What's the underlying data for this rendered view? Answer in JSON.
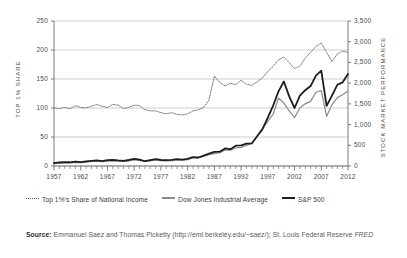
{
  "chart_data": {
    "type": "line",
    "title": "",
    "subtitle": "",
    "xlabel": "",
    "ylabel": "TOP 1% SHARE",
    "y2label": "STOCK MARKET PERFORMANCE",
    "grid": true,
    "legend_position": "bottom",
    "xlim": [
      1957,
      2012
    ],
    "ylim": [
      0,
      250
    ],
    "y2lim": [
      0,
      3500
    ],
    "x_ticks": [
      "1957",
      "1962",
      "1967",
      "1972",
      "1977",
      "1982",
      "1987",
      "1992",
      "1997",
      "2002",
      "2007",
      "2012"
    ],
    "x_minor_tick_interval": 1,
    "y_ticks_left": [
      "0",
      "50",
      "100",
      "150",
      "200",
      "250"
    ],
    "y_ticks_right": [
      "0",
      "500",
      "1,000",
      "1,500",
      "2,000",
      "2,500",
      "3,000",
      "3,500"
    ],
    "x": [
      1957,
      1958,
      1959,
      1960,
      1961,
      1962,
      1963,
      1964,
      1965,
      1966,
      1967,
      1968,
      1969,
      1970,
      1971,
      1972,
      1973,
      1974,
      1975,
      1976,
      1977,
      1978,
      1979,
      1980,
      1981,
      1982,
      1983,
      1984,
      1985,
      1986,
      1987,
      1988,
      1989,
      1990,
      1991,
      1992,
      1993,
      1994,
      1995,
      1996,
      1997,
      1998,
      1999,
      2000,
      2001,
      2002,
      2003,
      2004,
      2005,
      2006,
      2007,
      2008,
      2009,
      2010,
      2011,
      2012
    ],
    "series": [
      {
        "name": "Top 1%'s Share of National Income",
        "axis": "left",
        "style": "dotted",
        "color": "#666666",
        "values": [
          100,
          99,
          101,
          99,
          104,
          101,
          100,
          103,
          106,
          103,
          101,
          106,
          105,
          99,
          101,
          105,
          104,
          97,
          95,
          95,
          92,
          90,
          92,
          89,
          88,
          90,
          95,
          97,
          101,
          114,
          155,
          144,
          138,
          143,
          140,
          148,
          141,
          139,
          145,
          152,
          163,
          172,
          183,
          188,
          178,
          168,
          172,
          186,
          196,
          206,
          212,
          196,
          180,
          193,
          198,
          196
        ]
      },
      {
        "name": "Dow Jones Industrial Average",
        "axis": "right",
        "style": "solid",
        "color": "#8d8d8d",
        "values": [
          60,
          75,
          80,
          75,
          90,
          80,
          95,
          110,
          115,
          105,
          120,
          125,
          115,
          110,
          125,
          145,
          135,
          110,
          125,
          145,
          130,
          125,
          130,
          145,
          140,
          155,
          200,
          195,
          230,
          275,
          300,
          320,
          390,
          380,
          440,
          450,
          500,
          545,
          715,
          905,
          1080,
          1250,
          1640,
          1520,
          1330,
          1170,
          1400,
          1500,
          1560,
          1780,
          1820,
          1200,
          1480,
          1650,
          1720,
          1810
        ]
      },
      {
        "name": "S&P 500",
        "axis": "right",
        "style": "solid-bold",
        "color": "#1d1d1d",
        "values": [
          70,
          85,
          95,
          90,
          105,
          95,
          110,
          125,
          135,
          120,
          140,
          150,
          135,
          125,
          145,
          170,
          155,
          115,
          140,
          165,
          145,
          140,
          150,
          165,
          155,
          170,
          215,
          205,
          250,
          300,
          340,
          345,
          425,
          405,
          490,
          500,
          540,
          545,
          720,
          890,
          1170,
          1460,
          1800,
          2040,
          1680,
          1400,
          1700,
          1830,
          1930,
          2180,
          2300,
          1450,
          1700,
          1960,
          2020,
          2220
        ]
      }
    ]
  },
  "legend": {
    "items": [
      {
        "label": "Top 1%'s Share of National Income",
        "marker": "dotted-line-swatch"
      },
      {
        "label": "Dow Jones Industrial Average",
        "marker": "gray-line-swatch"
      },
      {
        "label": "S&P 500",
        "marker": "black-line-swatch"
      }
    ]
  },
  "source_note": {
    "prefix": "Source:",
    "text_part_1": " Emmanuel Saez and Thomas Picketty (http://eml.berkeley.edu/~saez/); St. Louis Federal Reserve ",
    "italic_part": "FRED"
  },
  "colors": {
    "top1_line": "#666666",
    "dow_line": "#8d8d8d",
    "sp500_line": "#1d1d1d",
    "gridline": "#b9b9b9",
    "axis": "#6e6e6e",
    "text": "#4a4a4a"
  }
}
